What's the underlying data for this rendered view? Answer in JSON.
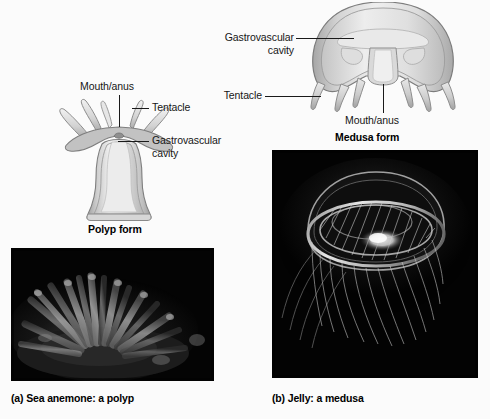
{
  "figure": {
    "background_color": "#fbfbfb",
    "line_color": "#1a1a1a",
    "drawing_fill_light": "#f2f2f2",
    "drawing_fill_mid": "#c9c9c9",
    "drawing_fill_dark": "#9a9a9a"
  },
  "polyp": {
    "form_label": "Polyp form",
    "labels": {
      "mouth_anus": "Mouth/anus",
      "tentacle": "Tentacle",
      "gastrovascular_cavity": "Gastrovascular\ncavity"
    }
  },
  "medusa": {
    "form_label": "Medusa form",
    "labels": {
      "gastrovascular_cavity": "Gastrovascular\ncavity",
      "tentacle": "Tentacle",
      "mouth_anus": "Mouth/anus"
    }
  },
  "photos": [
    {
      "id": "sea-anemone",
      "caption": "(a) Sea anemone: a polyp",
      "subject": "sea anemone with radiating tentacles on dark seafloor",
      "background_color": "#050505"
    },
    {
      "id": "jelly",
      "caption": "(b) Jelly: a medusa",
      "subject": "translucent jellyfish bell with trailing tentacles on black background",
      "background_color": "#030303"
    }
  ]
}
